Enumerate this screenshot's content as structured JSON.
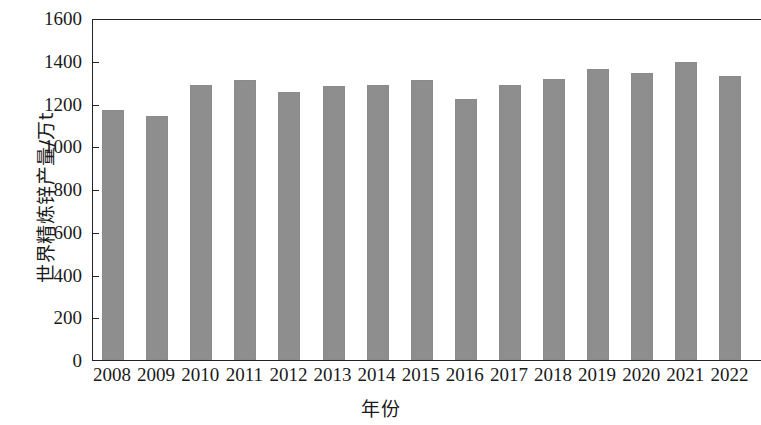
{
  "chart_data": {
    "type": "bar",
    "title": "",
    "xlabel": "年份",
    "ylabel": "世界精炼锌产量/万t",
    "categories": [
      "2008",
      "2009",
      "2010",
      "2011",
      "2012",
      "2013",
      "2014",
      "2015",
      "2016",
      "2017",
      "2018",
      "2019",
      "2020",
      "2021",
      "2022"
    ],
    "values": [
      1168,
      1141,
      1288,
      1310,
      1255,
      1280,
      1287,
      1308,
      1222,
      1288,
      1315,
      1362,
      1343,
      1392,
      1327
    ],
    "ylim": [
      0,
      1600
    ],
    "ytick_values": [
      0,
      200,
      400,
      600,
      800,
      1000,
      1200,
      1400,
      1600
    ],
    "ytick_labels": [
      "0",
      "200",
      "400",
      "600",
      "800",
      "1000",
      "1200",
      "1400",
      "1600"
    ],
    "grid": false,
    "legend": null,
    "bar_color": "#8e8e8e",
    "axis_color": "#222222"
  }
}
